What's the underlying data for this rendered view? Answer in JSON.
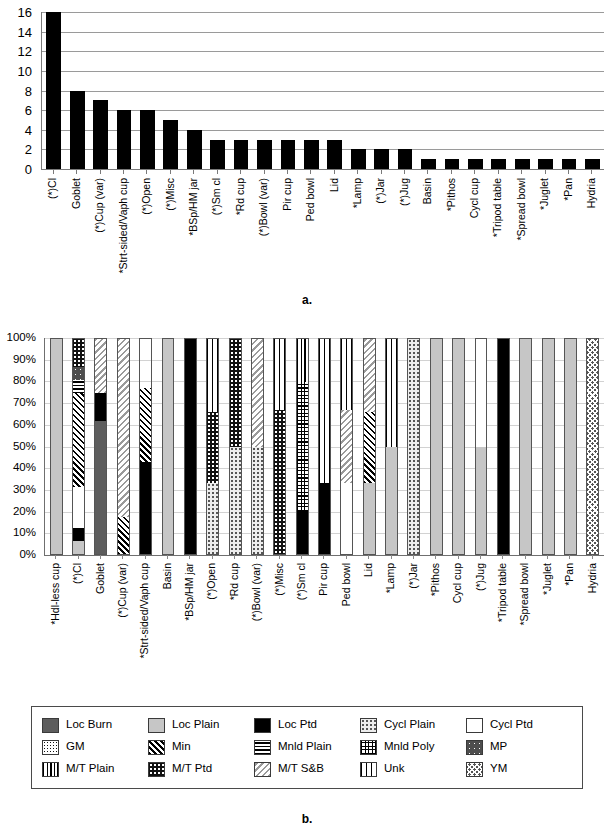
{
  "figure": {
    "caption_a": "a.",
    "caption_b": "b."
  },
  "chart_data": [
    {
      "type": "bar",
      "panel": "a",
      "title": "",
      "xlabel": "",
      "ylabel": "",
      "ylim": [
        0,
        16
      ],
      "yticks": [
        0,
        2,
        4,
        6,
        8,
        10,
        12,
        14,
        16
      ],
      "ytick_labels": [
        "0",
        "2",
        "4",
        "6",
        "8",
        "10",
        "12",
        "14",
        "16"
      ],
      "grid": true,
      "legend": "none",
      "bar_color": "#000000",
      "categories": [
        "(*)Cl",
        "Goblet",
        "(*)Cup (var)",
        "*Strt-sided/Vaph cup",
        "(*)Open",
        "(*)Misc",
        "*BSp/HM jar",
        "(*)Sm cl",
        "*Rd cup",
        "(*)Bowl (var)",
        "Pir cup",
        "Ped bowl",
        "Lid",
        "*Lamp",
        "(*)Jar",
        "(*)Jug",
        "Basin",
        "*Pithos",
        "Cycl cup",
        "*Tripod table",
        "*Spread bowl",
        "*Juglet",
        "*Pan",
        "Hydria"
      ],
      "values": [
        16,
        8,
        7,
        6,
        6,
        5,
        4,
        3,
        3,
        3,
        3,
        3,
        3,
        2,
        2,
        2,
        1,
        1,
        1,
        1,
        1,
        1,
        1,
        1
      ]
    },
    {
      "type": "bar",
      "subtype": "stacked-100-percent",
      "panel": "b",
      "title": "",
      "xlabel": "",
      "ylabel": "",
      "ylim": [
        0,
        100
      ],
      "yticks": [
        0,
        10,
        20,
        30,
        40,
        50,
        60,
        70,
        80,
        90,
        100
      ],
      "ytick_labels": [
        "0%",
        "10%",
        "20%",
        "30%",
        "40%",
        "50%",
        "60%",
        "70%",
        "80%",
        "90%",
        "100%"
      ],
      "grid": true,
      "legend": "bottom",
      "categories": [
        "*Hdl-less cup",
        "(*)Cl",
        "Goblet",
        "(*)Cup (var)",
        "*Strt-sided/Vaph cup",
        "Basin",
        "*BSp/HM jar",
        "(*)Open",
        "*Rd cup",
        "(*)Bowl (var)",
        "(*)Misc",
        "(*)Sm cl",
        "Pir cup",
        "Ped bowl",
        "Lid",
        "*Lamp",
        "(*)Jar",
        "*Pithos",
        "Cycl cup",
        "(*)Jug",
        "*Tripod table",
        "*Spread bowl",
        "*Juglet",
        "*Pan",
        "Hydria"
      ],
      "series": [
        {
          "name": "Loc Burn",
          "key": "loc_burn",
          "pattern": "p-locburn",
          "values": [
            0,
            0,
            62,
            0,
            0,
            0,
            0,
            0,
            0,
            0,
            0,
            0,
            0,
            0,
            0,
            0,
            0,
            0,
            0,
            0,
            0,
            0,
            0,
            0,
            0
          ]
        },
        {
          "name": "Loc Plain",
          "key": "loc_plain",
          "pattern": "p-locplain",
          "values": [
            100,
            6,
            0,
            0,
            0,
            100,
            0,
            0,
            0,
            0,
            0,
            0,
            0,
            0,
            33,
            50,
            0,
            100,
            100,
            50,
            0,
            100,
            100,
            100,
            0
          ]
        },
        {
          "name": "Loc Ptd",
          "key": "loc_ptd",
          "pattern": "p-locptd",
          "values": [
            0,
            6,
            13,
            0,
            43,
            0,
            100,
            0,
            0,
            0,
            0,
            20,
            33,
            0,
            0,
            0,
            0,
            0,
            0,
            0,
            100,
            0,
            0,
            0,
            0
          ]
        },
        {
          "name": "Cycl Plain",
          "key": "cycl_plain",
          "pattern": "p-cyclplain",
          "values": [
            0,
            0,
            0,
            0,
            0,
            0,
            0,
            33,
            50,
            50,
            0,
            0,
            0,
            0,
            0,
            0,
            100,
            0,
            0,
            0,
            0,
            0,
            0,
            0,
            0
          ]
        },
        {
          "name": "Cycl Ptd",
          "key": "cycl_ptd",
          "pattern": "p-cyclptd",
          "values": [
            0,
            19,
            0,
            0,
            0,
            0,
            0,
            0,
            0,
            0,
            0,
            0,
            0,
            33,
            0,
            0,
            0,
            0,
            0,
            50,
            0,
            0,
            0,
            0,
            0
          ]
        },
        {
          "name": "GM",
          "key": "gm",
          "pattern": "p-gm",
          "values": [
            0,
            0,
            0,
            0,
            0,
            0,
            0,
            0,
            0,
            0,
            0,
            0,
            0,
            0,
            0,
            0,
            0,
            0,
            0,
            0,
            0,
            0,
            0,
            0,
            0
          ]
        },
        {
          "name": "Min",
          "key": "min",
          "pattern": "p-min",
          "values": [
            0,
            44,
            0,
            17,
            34,
            0,
            0,
            0,
            0,
            0,
            0,
            0,
            0,
            0,
            33,
            0,
            0,
            0,
            0,
            0,
            0,
            0,
            0,
            0,
            0
          ]
        },
        {
          "name": "Mnld Plain",
          "key": "mnld_plain",
          "pattern": "p-mnldplain",
          "values": [
            0,
            6,
            0,
            0,
            0,
            0,
            0,
            0,
            0,
            0,
            0,
            0,
            0,
            0,
            0,
            0,
            0,
            0,
            0,
            0,
            0,
            0,
            0,
            0,
            0
          ]
        },
        {
          "name": "Mnld Poly",
          "key": "mnld_poly",
          "pattern": "p-mnldpoly",
          "values": [
            0,
            0,
            0,
            0,
            0,
            0,
            0,
            0,
            0,
            0,
            0,
            60,
            0,
            0,
            0,
            0,
            0,
            0,
            0,
            0,
            0,
            0,
            0,
            0,
            0
          ]
        },
        {
          "name": "MP",
          "key": "mp",
          "pattern": "p-mp",
          "values": [
            0,
            6,
            0,
            0,
            0,
            0,
            0,
            0,
            0,
            0,
            0,
            0,
            0,
            0,
            0,
            0,
            0,
            0,
            0,
            0,
            0,
            0,
            0,
            0,
            0
          ]
        },
        {
          "name": "M/T Plain",
          "key": "mt_plain",
          "pattern": "p-mtplain",
          "values": [
            0,
            0,
            0,
            0,
            0,
            0,
            0,
            0,
            0,
            0,
            0,
            20,
            0,
            0,
            0,
            0,
            0,
            0,
            0,
            0,
            0,
            0,
            0,
            0,
            0
          ]
        },
        {
          "name": "M/T Ptd",
          "key": "mt_ptd",
          "pattern": "p-mtptd",
          "values": [
            0,
            13,
            0,
            0,
            0,
            0,
            0,
            33,
            50,
            0,
            67,
            0,
            0,
            0,
            0,
            0,
            0,
            0,
            0,
            0,
            0,
            0,
            0,
            0,
            0
          ]
        },
        {
          "name": "M/T S&B",
          "key": "mt_sb",
          "pattern": "p-mtsb",
          "values": [
            0,
            0,
            25,
            83,
            0,
            0,
            0,
            0,
            0,
            50,
            0,
            0,
            0,
            34,
            34,
            0,
            0,
            0,
            0,
            0,
            0,
            0,
            0,
            0,
            0
          ]
        },
        {
          "name": "Unk",
          "key": "unk",
          "pattern": "p-unk",
          "values": [
            0,
            0,
            0,
            0,
            0,
            0,
            0,
            34,
            0,
            0,
            33,
            0,
            67,
            33,
            0,
            50,
            0,
            0,
            0,
            0,
            0,
            0,
            0,
            0,
            0
          ]
        },
        {
          "name": "YM",
          "key": "ym",
          "pattern": "p-ym",
          "values": [
            0,
            0,
            0,
            0,
            0,
            0,
            0,
            0,
            0,
            0,
            0,
            0,
            0,
            0,
            0,
            0,
            0,
            0,
            0,
            0,
            0,
            0,
            0,
            0,
            100
          ]
        }
      ]
    }
  ],
  "legend": {
    "items": [
      {
        "label": "Loc Burn",
        "pattern": "p-locburn"
      },
      {
        "label": "Loc Plain",
        "pattern": "p-locplain"
      },
      {
        "label": "Loc Ptd",
        "pattern": "p-locptd"
      },
      {
        "label": "Cycl Plain",
        "pattern": "p-cyclplain"
      },
      {
        "label": "Cycl Ptd",
        "pattern": "p-cyclptd"
      },
      {
        "label": "GM",
        "pattern": "p-gm"
      },
      {
        "label": "Min",
        "pattern": "p-min"
      },
      {
        "label": "Mnld Plain",
        "pattern": "p-mnldplain"
      },
      {
        "label": "Mnld Poly",
        "pattern": "p-mnldpoly"
      },
      {
        "label": "MP",
        "pattern": "p-mp"
      },
      {
        "label": "M/T Plain",
        "pattern": "p-mtplain"
      },
      {
        "label": "M/T Ptd",
        "pattern": "p-mtptd"
      },
      {
        "label": "M/T S&B",
        "pattern": "p-mtsb"
      },
      {
        "label": "Unk",
        "pattern": "p-unk"
      },
      {
        "label": "YM",
        "pattern": "p-ym"
      }
    ]
  }
}
